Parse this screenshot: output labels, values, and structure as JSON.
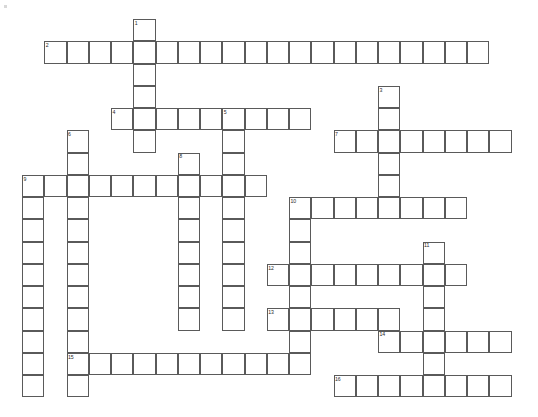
{
  "puzzle": {
    "type": "crossword-grid",
    "title": "Crossword puzzle grid",
    "canvas": {
      "width": 538,
      "height": 417,
      "background": "#ffffff"
    },
    "grid": {
      "origin_x": 22,
      "origin_y": 19,
      "cell": 22.25,
      "line_color": "#5a5a5a",
      "cell_fill": "#ffffff",
      "number_color": "#2a2a2a"
    },
    "entries": [
      {
        "number": "1",
        "direction": "down",
        "row": 0,
        "col": 5,
        "length": 6
      },
      {
        "number": "2",
        "direction": "across",
        "row": 1,
        "col": 1,
        "length": 20
      },
      {
        "number": "3",
        "direction": "down",
        "row": 3,
        "col": 16,
        "length": 6
      },
      {
        "number": "4",
        "direction": "across",
        "row": 4,
        "col": 4,
        "length": 9
      },
      {
        "number": "5",
        "direction": "down",
        "row": 4,
        "col": 9,
        "length": 10
      },
      {
        "number": "6",
        "direction": "down",
        "row": 5,
        "col": 2,
        "length": 12
      },
      {
        "number": "7",
        "direction": "across",
        "row": 5,
        "col": 14,
        "length": 8
      },
      {
        "number": "8",
        "direction": "down",
        "row": 6,
        "col": 7,
        "length": 8
      },
      {
        "number": "9",
        "direction": "across",
        "row": 7,
        "col": 0,
        "length": 11
      },
      {
        "number": "9",
        "direction": "down",
        "row": 7,
        "col": 0,
        "length": 10
      },
      {
        "number": "10",
        "direction": "across",
        "row": 8,
        "col": 12,
        "length": 8
      },
      {
        "number": "10",
        "direction": "down",
        "row": 8,
        "col": 12,
        "length": 8
      },
      {
        "number": "11",
        "direction": "down",
        "row": 10,
        "col": 18,
        "length": 7
      },
      {
        "number": "12",
        "direction": "across",
        "row": 11,
        "col": 11,
        "length": 9
      },
      {
        "number": "13",
        "direction": "across",
        "row": 13,
        "col": 11,
        "length": 6
      },
      {
        "number": "14",
        "direction": "across",
        "row": 14,
        "col": 16,
        "length": 6
      },
      {
        "number": "15",
        "direction": "across",
        "row": 15,
        "col": 2,
        "length": 11
      },
      {
        "number": "16",
        "direction": "across",
        "row": 16,
        "col": 14,
        "length": 8
      }
    ],
    "numbers_visible": [
      "1",
      "2",
      "3",
      "4",
      "5",
      "6",
      "7",
      "8",
      "9",
      "10",
      "11",
      "12",
      "13",
      "14",
      "15",
      "16"
    ]
  }
}
